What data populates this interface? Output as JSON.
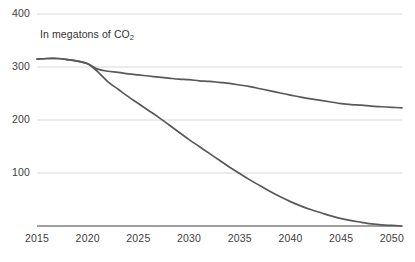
{
  "chart_data": {
    "type": "line",
    "title": "",
    "subtitle": "In megatons of CO",
    "subtitle_subscript": "2",
    "xlabel": "",
    "ylabel": "",
    "xlim": [
      2015,
      2051
    ],
    "ylim": [
      0,
      400
    ],
    "x_ticks": [
      "2015",
      "2020",
      "2025",
      "2030",
      "2035",
      "2040",
      "2045",
      "2050"
    ],
    "x_tick_values": [
      2015,
      2020,
      2025,
      2030,
      2035,
      2040,
      2045,
      2050
    ],
    "y_ticks": [
      "400",
      "300",
      "200",
      "100"
    ],
    "y_tick_values": [
      400,
      300,
      200,
      100
    ],
    "grid": true,
    "grid_color": "#d9d9d9",
    "axis_color": "#808080",
    "legend": "none",
    "series": [
      {
        "name": "Reference trajectory",
        "color": "#595959",
        "x": [
          2015,
          2016,
          2017,
          2018,
          2019,
          2020,
          2021,
          2022,
          2023,
          2024,
          2025,
          2026,
          2027,
          2028,
          2029,
          2030,
          2031,
          2032,
          2033,
          2034,
          2035,
          2036,
          2037,
          2038,
          2039,
          2040,
          2041,
          2042,
          2043,
          2044,
          2045,
          2046,
          2047,
          2048,
          2049,
          2050,
          2051
        ],
        "values": [
          315,
          316,
          316,
          314,
          311,
          306,
          296,
          292,
          290,
          287,
          285,
          283,
          281,
          279,
          277,
          276,
          274,
          273,
          271,
          269,
          266,
          263,
          259,
          255,
          251,
          247,
          243,
          240,
          237,
          234,
          231,
          229,
          228,
          226,
          225,
          224,
          223
        ]
      },
      {
        "name": "Decarbonization trajectory",
        "color": "#595959",
        "x": [
          2015,
          2016,
          2017,
          2018,
          2019,
          2020,
          2021,
          2022,
          2023,
          2024,
          2025,
          2026,
          2027,
          2028,
          2029,
          2030,
          2031,
          2032,
          2033,
          2034,
          2035,
          2036,
          2037,
          2038,
          2039,
          2040,
          2041,
          2042,
          2043,
          2044,
          2045,
          2046,
          2047,
          2048,
          2049,
          2050,
          2051
        ],
        "values": [
          315,
          316,
          316,
          314,
          311,
          306,
          291,
          272,
          258,
          244,
          231,
          218,
          205,
          191,
          177,
          163,
          150,
          137,
          124,
          111,
          99,
          87,
          76,
          65,
          55,
          46,
          38,
          31,
          25,
          19,
          14,
          10,
          7,
          4,
          2,
          1,
          0
        ]
      }
    ]
  }
}
